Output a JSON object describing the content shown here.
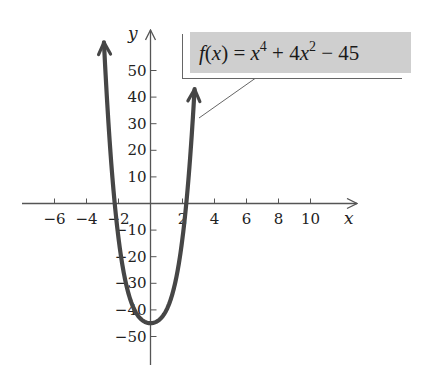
{
  "chart_data": {
    "type": "line",
    "title": "",
    "function_label": "f(x) = x^4 + 4x^2 - 45",
    "formula_parts": {
      "f": "f",
      "open": "(",
      "x": "x",
      "close": ")",
      "eq": " = ",
      "x1": "x",
      "exp1": "4",
      "plus": " + 4",
      "x2": "x",
      "exp2": "2",
      "minus": " − 45"
    },
    "xlabel": "x",
    "ylabel": "y",
    "xlim": [
      -8,
      13
    ],
    "ylim": [
      -60,
      60
    ],
    "x_ticks": [
      -6,
      -4,
      -2,
      2,
      4,
      6,
      8,
      10
    ],
    "x_tick_labels": [
      "−6",
      "−4",
      "−2",
      "2",
      "4",
      "6",
      "8",
      "10"
    ],
    "y_ticks": [
      50,
      40,
      30,
      20,
      10,
      -10,
      -20,
      -30,
      -40,
      -50
    ],
    "y_tick_labels": [
      "50",
      "40",
      "30",
      "20",
      "10",
      "−10",
      "−20",
      "−30",
      "−40",
      "−50"
    ],
    "grid": false,
    "series": [
      {
        "name": "f(x) = x^4 + 4x^2 - 45",
        "x_range": [
          -2.91,
          2.755
        ],
        "key_points": [
          {
            "x": -2.91,
            "y": 61
          },
          {
            "x": -2.236,
            "y": 0
          },
          {
            "x": 0,
            "y": -45
          },
          {
            "x": 2.236,
            "y": 0
          },
          {
            "x": 2.755,
            "y": 43
          }
        ],
        "color": "#444444"
      }
    ]
  },
  "colors": {
    "curve": "#464646",
    "axis": "#555555",
    "label_box": "#cfcfcf"
  }
}
